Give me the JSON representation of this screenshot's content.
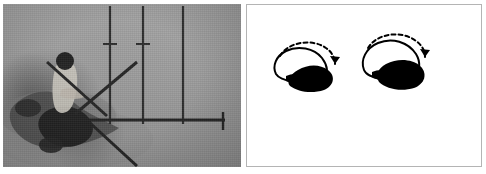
{
  "figure": {
    "panel_count": 2,
    "background_color": "#ffffff"
  },
  "panels": [
    {
      "id": "photo-panel",
      "kind": "photograph",
      "label": "left-photograph",
      "tone": "grayscale",
      "background_color": "#9b9b9b",
      "border_color": "#6d6d6d",
      "contents": {
        "subject": "dark figure on ground with rods",
        "vertical_poles": 3,
        "cross_marks": 2,
        "diagonal_rods": 3,
        "horizontal_bar": 1,
        "horizontal_bar_end_cap": "T-cap"
      }
    },
    {
      "id": "drawing-panel",
      "kind": "line-drawing",
      "label": "right-line-drawing",
      "tone": "black-and-white",
      "background_color": "#ffffff",
      "border_color": "#b4b4b4",
      "contents": {
        "shape_count": 2,
        "shape_fill": "#000000",
        "shape_outline": "#000000",
        "arrow_style": "dashed-arc",
        "arrow_direction": "clockwise",
        "shapes": [
          {
            "name": "left-outline-shape",
            "cx": 58,
            "cy": 60
          },
          {
            "name": "right-outline-shape",
            "cx": 148,
            "cy": 52
          }
        ]
      }
    }
  ],
  "colors": {
    "ink": "#000000",
    "photo_mid_gray": "#9b9b9b",
    "photo_dark": "#2b2b2b",
    "panel_border": "#b4b4b4",
    "photo_border": "#6d6d6d"
  },
  "captions": {
    "left": "",
    "right": ""
  }
}
